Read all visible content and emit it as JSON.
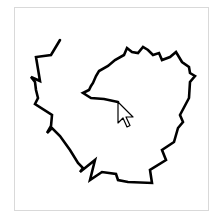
{
  "canvas": {
    "background": "#ffffff",
    "border_color": "#d9d9d9",
    "stroke_color": "#000000",
    "stroke_width": 2.6
  },
  "drawing": {
    "description": "hand-drawn spiral stroke",
    "path_points": [
      [
        60,
        40
      ],
      [
        51,
        55
      ],
      [
        36,
        57
      ],
      [
        40,
        81
      ],
      [
        31,
        77
      ],
      [
        35,
        82
      ],
      [
        36,
        90
      ],
      [
        38,
        98
      ],
      [
        35,
        104
      ],
      [
        52,
        115
      ],
      [
        51,
        126
      ],
      [
        47,
        133
      ],
      [
        52,
        128
      ],
      [
        60,
        136
      ],
      [
        70,
        150
      ],
      [
        78,
        163
      ],
      [
        83,
        168
      ],
      [
        80,
        172
      ],
      [
        95,
        160
      ],
      [
        90,
        180
      ],
      [
        102,
        172
      ],
      [
        116,
        174
      ],
      [
        118,
        180
      ],
      [
        128,
        182
      ],
      [
        152,
        183
      ],
      [
        150,
        170
      ],
      [
        166,
        160
      ],
      [
        162,
        150
      ],
      [
        174,
        142
      ],
      [
        178,
        128
      ],
      [
        183,
        122
      ],
      [
        180,
        115
      ],
      [
        189,
        98
      ],
      [
        190,
        82
      ],
      [
        195,
        76
      ],
      [
        190,
        73
      ],
      [
        189,
        67
      ],
      [
        182,
        62
      ],
      [
        176,
        52
      ],
      [
        170,
        57
      ],
      [
        162,
        60
      ],
      [
        159,
        53
      ],
      [
        153,
        55
      ],
      [
        148,
        50
      ],
      [
        143,
        47
      ],
      [
        138,
        53
      ],
      [
        132,
        52
      ],
      [
        127,
        48
      ],
      [
        124,
        55
      ],
      [
        115,
        60
      ],
      [
        108,
        66
      ],
      [
        99,
        71
      ],
      [
        96,
        76
      ],
      [
        93,
        83
      ],
      [
        91,
        86
      ],
      [
        89,
        90
      ],
      [
        83,
        93
      ],
      [
        91,
        98
      ],
      [
        104,
        99
      ],
      [
        118,
        102
      ]
    ]
  },
  "cursor": {
    "icon": "arrow-pointer-icon",
    "x": 118,
    "y": 102
  }
}
